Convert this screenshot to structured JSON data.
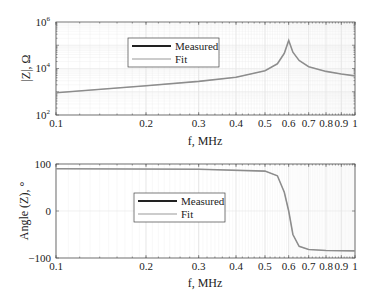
{
  "chart_data": [
    {
      "type": "line",
      "title": "",
      "xlabel": "f, MHz",
      "ylabel": "|Z|, Ω",
      "xscale": "log",
      "yscale": "log",
      "xlim": [
        0.1,
        1
      ],
      "ylim": [
        100,
        1000000
      ],
      "x_ticks": [
        "0.1",
        "0.2",
        "0.3",
        "0.4",
        "0.5",
        "0.6",
        "0.7",
        "0.8",
        "0.9",
        "1"
      ],
      "y_ticks": [
        "10^2",
        "10^4",
        "10^6"
      ],
      "grid": true,
      "legend_position": "upper-left-center",
      "legend": [
        "Measured",
        "Fit"
      ],
      "series": [
        {
          "name": "Measured",
          "color": "#222222",
          "x": [
            0.1,
            0.2,
            0.3,
            0.4,
            0.5,
            0.55,
            0.58,
            0.6,
            0.62,
            0.65,
            0.7,
            0.8,
            0.9,
            1.0
          ],
          "values": [
            900,
            1800,
            2800,
            4200,
            8000,
            16000,
            45000,
            160000,
            50000,
            22000,
            12000,
            7500,
            5800,
            4800
          ]
        },
        {
          "name": "Fit",
          "color": "#999999",
          "x": [
            0.1,
            0.2,
            0.3,
            0.4,
            0.5,
            0.55,
            0.58,
            0.6,
            0.62,
            0.65,
            0.7,
            0.8,
            0.9,
            1.0
          ],
          "values": [
            900,
            1800,
            2800,
            4200,
            8000,
            16000,
            45000,
            160000,
            50000,
            22000,
            12000,
            7500,
            5800,
            4800
          ]
        }
      ]
    },
    {
      "type": "line",
      "title": "",
      "xlabel": "f, MHz",
      "ylabel": "Angle (Z), °",
      "xscale": "log",
      "yscale": "linear",
      "xlim": [
        0.1,
        1
      ],
      "ylim": [
        -100,
        100
      ],
      "x_ticks": [
        "0.1",
        "0.2",
        "0.3",
        "0.4",
        "0.5",
        "0.6",
        "0.7",
        "0.8",
        "0.9",
        "1"
      ],
      "y_ticks": [
        "-100",
        "0",
        "100"
      ],
      "grid": true,
      "legend_position": "center-left",
      "legend": [
        "Measured",
        "Fit"
      ],
      "series": [
        {
          "name": "Measured",
          "color": "#222222",
          "x": [
            0.1,
            0.3,
            0.5,
            0.55,
            0.58,
            0.6,
            0.62,
            0.65,
            0.7,
            0.8,
            1.0
          ],
          "values": [
            90,
            89,
            85,
            75,
            40,
            0,
            -50,
            -75,
            -82,
            -84,
            -85
          ]
        },
        {
          "name": "Fit",
          "color": "#999999",
          "x": [
            0.1,
            0.3,
            0.5,
            0.55,
            0.58,
            0.6,
            0.62,
            0.65,
            0.7,
            0.8,
            1.0
          ],
          "values": [
            90,
            89,
            85,
            75,
            40,
            0,
            -50,
            -75,
            -82,
            -84,
            -85
          ]
        }
      ]
    }
  ],
  "top_plot": {
    "ylabel": "|Z|, Ω",
    "xlabel": "f, MHz",
    "y_tick_labels": [
      {
        "base": "10",
        "exp": "6"
      },
      {
        "base": "10",
        "exp": "4"
      },
      {
        "base": "10",
        "exp": "2"
      }
    ],
    "x_tick_labels": [
      "0.1",
      "0.2",
      "0.3",
      "0.4",
      "0.5",
      "0.6",
      "0.7",
      "0.8",
      "0.9",
      "1"
    ],
    "legend": {
      "measured": "Measured",
      "fit": "Fit"
    }
  },
  "bottom_plot": {
    "ylabel": "Angle (Z),  °",
    "xlabel": "f, MHz",
    "y_tick_labels": [
      "100",
      "0",
      "−100"
    ],
    "x_tick_labels": [
      "0.1",
      "0.2",
      "0.3",
      "0.4",
      "0.5",
      "0.6",
      "0.7",
      "0.8",
      "0.9",
      "1"
    ],
    "legend": {
      "measured": "Measured",
      "fit": "Fit"
    }
  },
  "colors": {
    "measured": "#222222",
    "fit": "#9a9a9a",
    "axis": "#555555",
    "grid": "#e4e4e4"
  }
}
